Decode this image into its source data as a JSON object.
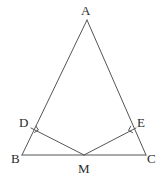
{
  "figure": {
    "background_color": "#ffffff",
    "stroke_color": "#555555",
    "label_color": "#2b2b2b",
    "stroke_width": 1,
    "canvas": {
      "width": 167,
      "height": 182
    },
    "points": {
      "A": {
        "label": "A",
        "x": 87,
        "y": 20
      },
      "B": {
        "label": "B",
        "x": 22,
        "y": 155
      },
      "C": {
        "label": "C",
        "x": 146,
        "y": 155
      },
      "D": {
        "label": "D",
        "x": 31,
        "y": 128
      },
      "E": {
        "label": "E",
        "x": 136,
        "y": 128
      },
      "M": {
        "label": "M",
        "x": 84,
        "y": 155
      }
    },
    "segments": [
      {
        "name": "segment-AB",
        "from": "A",
        "to": "B",
        "path": "M 87 20 L 22 155"
      },
      {
        "name": "segment-AC",
        "from": "A",
        "to": "C",
        "path": "M 87 20 L 146 155"
      },
      {
        "name": "segment-BC",
        "from": "B",
        "to": "C",
        "path": "M 22 155 L 146 155"
      },
      {
        "name": "segment-DM",
        "from": "D",
        "to": "M",
        "path": "M 31 128 L 84 155"
      },
      {
        "name": "segment-EM",
        "from": "E",
        "to": "M",
        "path": "M 136 128 L 84 155"
      }
    ],
    "right_angle_marks": [
      {
        "name": "right-angle-mark-D",
        "at": "D",
        "path": "M 34.2 132.6 L 38.4 130.0 L 35.8 125.8"
      },
      {
        "name": "right-angle-mark-E",
        "at": "E",
        "path": "M 132.9 132.8 L 128.5 130.4 L 130.9 125.9"
      }
    ]
  }
}
